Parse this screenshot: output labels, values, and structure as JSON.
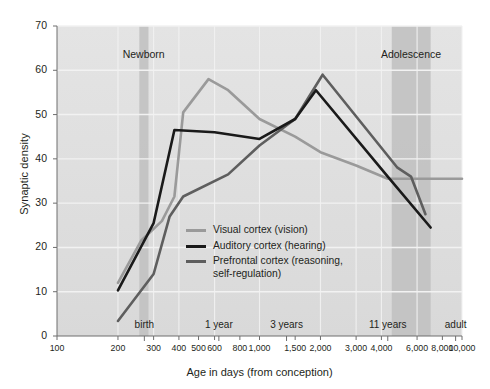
{
  "chart_data": {
    "type": "line",
    "title": "",
    "xlabel": "Age in days (from conception)",
    "ylabel": "Synaptic density",
    "xscale": "log",
    "xlim": [
      100,
      10000
    ],
    "ylim": [
      0,
      70
    ],
    "grid": true,
    "legend_position": "inside-center-left",
    "y_ticks": [
      0,
      10,
      20,
      30,
      40,
      50,
      60,
      70
    ],
    "x_ticks": [
      100,
      200,
      300,
      400,
      500,
      600,
      800,
      1000,
      1500,
      2000,
      3000,
      4000,
      6000,
      8000,
      10000
    ],
    "x_tick_labels": [
      "100",
      "200",
      "300",
      "400",
      "500",
      "600",
      "800",
      "1,000",
      "1,500",
      "2,000",
      "3,000",
      "4,000",
      "6,000",
      "8,000",
      "10,000"
    ],
    "annotations": {
      "top_bands": [
        {
          "label": "Newborn",
          "x_center": 268,
          "x_start": 255,
          "x_end": 283
        },
        {
          "label": "Adolescence",
          "x_center": 5600,
          "x_start": 4500,
          "x_end": 7000
        }
      ],
      "axis_markers": [
        {
          "label": "birth",
          "x": 270
        },
        {
          "label": "1 year",
          "x": 630
        },
        {
          "label": "3 years",
          "x": 1360
        },
        {
          "label": "11 years",
          "x": 4300
        },
        {
          "label": "adult",
          "x": 9300
        }
      ]
    },
    "series": [
      {
        "name": "Visual cortex (vision)",
        "legend_label": "Visual cortex (vision)",
        "color": "#9a9a9a",
        "points": [
          [
            200,
            12.0
          ],
          [
            260,
            21.5
          ],
          [
            330,
            26.0
          ],
          [
            380,
            31.5
          ],
          [
            420,
            50.5
          ],
          [
            560,
            58.0
          ],
          [
            700,
            55.5
          ],
          [
            1000,
            49.0
          ],
          [
            1500,
            45.0
          ],
          [
            2000,
            41.5
          ],
          [
            3000,
            38.5
          ],
          [
            4300,
            35.5
          ],
          [
            10000,
            35.5
          ]
        ]
      },
      {
        "name": "Auditory cortex (hearing)",
        "legend_label": "Auditory cortex (hearing)",
        "color": "#1a1a1a",
        "points": [
          [
            200,
            10.3
          ],
          [
            300,
            25.5
          ],
          [
            380,
            46.5
          ],
          [
            600,
            46.0
          ],
          [
            1000,
            44.5
          ],
          [
            1500,
            49.0
          ],
          [
            1900,
            55.5
          ],
          [
            4300,
            36.0
          ],
          [
            7000,
            24.5
          ]
        ]
      },
      {
        "name": "Prefrontal cortex (reasoning, self-regulation)",
        "legend_label": "Prefrontal cortex (reasoning,\nself-regulation)",
        "color": "#5e5e5e",
        "points": [
          [
            200,
            3.4
          ],
          [
            300,
            14.0
          ],
          [
            360,
            27.0
          ],
          [
            420,
            31.5
          ],
          [
            700,
            36.5
          ],
          [
            1000,
            43.0
          ],
          [
            1500,
            49.0
          ],
          [
            2050,
            59.0
          ],
          [
            4800,
            38.0
          ],
          [
            5600,
            36.0
          ],
          [
            6600,
            27.5
          ]
        ]
      }
    ]
  },
  "colors": {
    "plot_background": "#d9d9d9",
    "plot_background_light": "#e4e4e4",
    "gridline": "#f2f2f2",
    "band": "#bfbfbf",
    "axis": "#6e6e6e",
    "text": "#231f20"
  }
}
